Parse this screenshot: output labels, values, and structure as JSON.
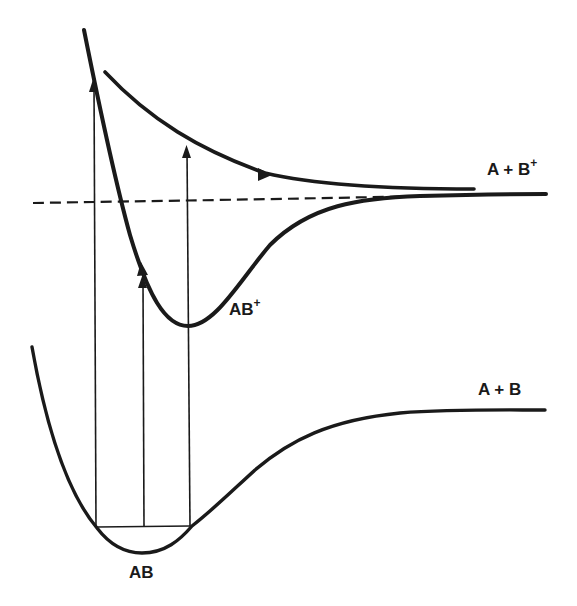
{
  "diagram": {
    "type": "potential-energy-curves",
    "colors": {
      "ink": "#1a1a1a",
      "background": "#ffffff"
    },
    "curves": [
      {
        "id": "ground-state",
        "label": "AB",
        "asymptote_label": "A + B"
      },
      {
        "id": "ion-bound-state",
        "label": "AB",
        "label_superscript": "+",
        "asymptote_label": "A + B",
        "asymptote_superscript": "+"
      },
      {
        "id": "ion-repulsive-state"
      },
      {
        "id": "ionization-threshold",
        "style": "dashed"
      }
    ],
    "labels": {
      "ground_minimum": "AB",
      "ion_minimum_base": "AB",
      "ion_minimum_sup": "+",
      "ground_asymptote": "A + B",
      "ion_asymptote_base": "A + B",
      "ion_asymptote_sup": "+"
    },
    "transitions": [
      {
        "id": "vertical-left",
        "to": "repulsive wall"
      },
      {
        "id": "vertical-center",
        "to": "AB+ bound curve"
      },
      {
        "id": "vertical-right",
        "to": "repulsive upper curve"
      }
    ]
  }
}
